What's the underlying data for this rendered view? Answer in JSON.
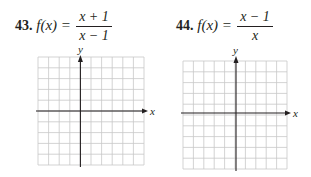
{
  "problems": [
    {
      "number": "43.",
      "lhs": "f(x) =",
      "numerator": "x + 1",
      "denominator": "x − 1",
      "grid": {
        "cols": 10,
        "rows": 10,
        "y_axis_col": 4,
        "x_axis_row": 5,
        "x_label": "x",
        "y_label": "y"
      }
    },
    {
      "number": "44.",
      "lhs": "f(x) =",
      "numerator": "x − 1",
      "denominator": "x",
      "grid": {
        "cols": 10,
        "rows": 10,
        "y_axis_col": 5,
        "x_axis_row": 5,
        "x_label": "x",
        "y_label": "y"
      }
    }
  ],
  "colors": {
    "grid_line": "#c8c8c8",
    "axis": "#231f20",
    "text": "#231f20"
  }
}
